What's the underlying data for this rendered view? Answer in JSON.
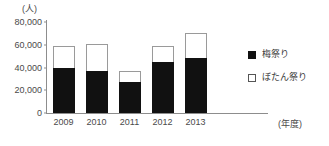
{
  "chart_data": {
    "type": "bar",
    "stacked": true,
    "title": "",
    "subtitle": "",
    "xlabel": "(年度)",
    "ylabel": "(人)",
    "categories": [
      "2009",
      "2010",
      "2011",
      "2012",
      "2013"
    ],
    "ylim": [
      0,
      80000
    ],
    "ytick_labels": [
      "80,000",
      "60,000",
      "40,000",
      "20,000",
      "0"
    ],
    "ytick_values": [
      80000,
      60000,
      40000,
      20000,
      0
    ],
    "grid": false,
    "legend_position": "right",
    "series": [
      {
        "name": "梅祭り",
        "color": "#111111",
        "style": "filled",
        "values": [
          39500,
          36500,
          27000,
          44500,
          48500
        ]
      },
      {
        "name": "ぼたん祭り",
        "color": "#ffffff",
        "style": "open",
        "values": [
          19000,
          24500,
          10000,
          14000,
          22000
        ]
      }
    ],
    "totals": [
      58500,
      61000,
      37000,
      58500,
      70500
    ]
  },
  "legend": {
    "items": [
      {
        "label": "梅祭り",
        "swatch": "filled-square-icon"
      },
      {
        "label": "ぼたん祭り",
        "swatch": "open-square-icon"
      }
    ]
  }
}
